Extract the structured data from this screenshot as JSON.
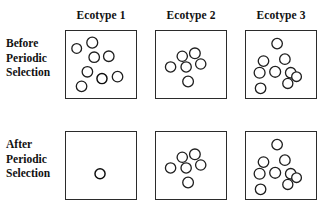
{
  "figure": {
    "background_color": "#ffffff",
    "line_color": "#2b2b2b",
    "cell_fill": "#ffffff",
    "mutant_color": "#1a1a1a"
  },
  "columns": [
    {
      "id": "ecotype-1",
      "label": "Ecotype 1",
      "x": 65,
      "width": 72
    },
    {
      "id": "ecotype-2",
      "label": "Ecotype 2",
      "x": 155,
      "width": 72
    },
    {
      "id": "ecotype-3",
      "label": "Ecotype 3",
      "x": 245,
      "width": 72
    }
  ],
  "rows": [
    {
      "id": "before",
      "label_lines": [
        "Before",
        "Periodic",
        "Selection"
      ],
      "label_x": 6,
      "label_y": 36,
      "y": 30,
      "height": 69
    },
    {
      "id": "after",
      "label_lines": [
        "After",
        "Periodic",
        "Selection"
      ],
      "label_x": 6,
      "label_y": 137,
      "y": 131,
      "height": 69
    }
  ],
  "header_y": 9,
  "legend": {
    "cell_symbol": "open-circle",
    "mutant_symbol": "spoked-circle",
    "cell_meaning": "individual cell",
    "mutant_meaning": "adaptive mutant"
  },
  "panels": [
    {
      "id": "before-ecotype-1",
      "row": "before",
      "column": "ecotype-1",
      "cell_count": 8,
      "mutant_count": 1,
      "cells": [
        {
          "cx": 11,
          "cy": 18,
          "r": 5.0,
          "type": "cell"
        },
        {
          "cx": 27,
          "cy": 12,
          "r": 5.6,
          "type": "cell"
        },
        {
          "cx": 29,
          "cy": 27,
          "r": 5.4,
          "type": "cell"
        },
        {
          "cx": 44,
          "cy": 26,
          "r": 5.4,
          "type": "cell"
        },
        {
          "cx": 22,
          "cy": 42,
          "r": 5.4,
          "type": "cell"
        },
        {
          "cx": 37,
          "cy": 49,
          "r": 5.2,
          "type": "mutant"
        },
        {
          "cx": 53,
          "cy": 47,
          "r": 5.4,
          "type": "cell"
        },
        {
          "cx": 16,
          "cy": 57,
          "r": 5.4,
          "type": "cell"
        }
      ]
    },
    {
      "id": "before-ecotype-2",
      "row": "before",
      "column": "ecotype-2",
      "cell_count": 6,
      "mutant_count": 0,
      "cells": [
        {
          "cx": 27,
          "cy": 26,
          "r": 5.3,
          "type": "cell"
        },
        {
          "cx": 40,
          "cy": 23,
          "r": 5.5,
          "type": "cell"
        },
        {
          "cx": 15,
          "cy": 37,
          "r": 5.3,
          "type": "cell"
        },
        {
          "cx": 31,
          "cy": 37,
          "r": 5.3,
          "type": "cell"
        },
        {
          "cx": 46,
          "cy": 34,
          "r": 5.3,
          "type": "cell"
        },
        {
          "cx": 33,
          "cy": 52,
          "r": 5.5,
          "type": "cell"
        }
      ]
    },
    {
      "id": "before-ecotype-3",
      "row": "before",
      "column": "ecotype-3",
      "cell_count": 9,
      "mutant_count": 0,
      "cells": [
        {
          "cx": 32,
          "cy": 13,
          "r": 5.4,
          "type": "cell"
        },
        {
          "cx": 18,
          "cy": 31,
          "r": 5.4,
          "type": "cell"
        },
        {
          "cx": 40,
          "cy": 29,
          "r": 5.4,
          "type": "cell"
        },
        {
          "cx": 14,
          "cy": 43,
          "r": 5.6,
          "type": "cell"
        },
        {
          "cx": 30,
          "cy": 42,
          "r": 5.6,
          "type": "cell"
        },
        {
          "cx": 46,
          "cy": 43,
          "r": 5.4,
          "type": "cell"
        },
        {
          "cx": 43,
          "cy": 54,
          "r": 5.2,
          "type": "cell"
        },
        {
          "cx": 52,
          "cy": 47,
          "r": 5.0,
          "type": "cell"
        },
        {
          "cx": 15,
          "cy": 59,
          "r": 5.4,
          "type": "cell"
        }
      ]
    },
    {
      "id": "after-ecotype-1",
      "row": "after",
      "column": "ecotype-1",
      "cell_count": 1,
      "mutant_count": 1,
      "cells": [
        {
          "cx": 35,
          "cy": 43,
          "r": 5.2,
          "type": "mutant"
        }
      ]
    },
    {
      "id": "after-ecotype-2",
      "row": "after",
      "column": "ecotype-2",
      "cell_count": 6,
      "mutant_count": 0,
      "cells": [
        {
          "cx": 27,
          "cy": 26,
          "r": 5.3,
          "type": "cell"
        },
        {
          "cx": 40,
          "cy": 23,
          "r": 5.5,
          "type": "cell"
        },
        {
          "cx": 15,
          "cy": 37,
          "r": 5.3,
          "type": "cell"
        },
        {
          "cx": 31,
          "cy": 37,
          "r": 5.3,
          "type": "cell"
        },
        {
          "cx": 46,
          "cy": 34,
          "r": 5.3,
          "type": "cell"
        },
        {
          "cx": 33,
          "cy": 52,
          "r": 5.5,
          "type": "cell"
        }
      ]
    },
    {
      "id": "after-ecotype-3",
      "row": "after",
      "column": "ecotype-3",
      "cell_count": 9,
      "mutant_count": 0,
      "cells": [
        {
          "cx": 32,
          "cy": 13,
          "r": 5.4,
          "type": "cell"
        },
        {
          "cx": 18,
          "cy": 31,
          "r": 5.4,
          "type": "cell"
        },
        {
          "cx": 40,
          "cy": 29,
          "r": 5.4,
          "type": "cell"
        },
        {
          "cx": 14,
          "cy": 43,
          "r": 5.6,
          "type": "cell"
        },
        {
          "cx": 30,
          "cy": 42,
          "r": 5.6,
          "type": "cell"
        },
        {
          "cx": 46,
          "cy": 43,
          "r": 5.4,
          "type": "cell"
        },
        {
          "cx": 43,
          "cy": 54,
          "r": 5.2,
          "type": "cell"
        },
        {
          "cx": 52,
          "cy": 47,
          "r": 5.0,
          "type": "cell"
        },
        {
          "cx": 15,
          "cy": 59,
          "r": 5.4,
          "type": "cell"
        }
      ]
    }
  ]
}
